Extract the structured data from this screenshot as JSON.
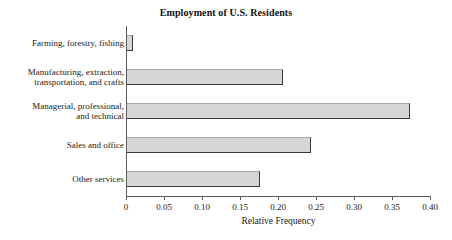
{
  "page": {
    "cropped_top_line": "",
    "background_color": "#ffffff"
  },
  "chart_data": {
    "type": "bar",
    "orientation": "horizontal",
    "title": "Employment of U.S. Residents",
    "xlabel": "Relative Frequency",
    "ylabel": "",
    "xlim": [
      0,
      0.4
    ],
    "grid": false,
    "legend": null,
    "bar_color": "#d6d6d6",
    "bar_edge_color": "#3a3a3a",
    "axis_color": "#5a5a5a",
    "xticks": [
      0,
      0.05,
      0.1,
      0.15,
      0.2,
      0.25,
      0.3,
      0.35,
      0.4
    ],
    "xtick_labels": [
      "0",
      "0.05",
      "0.10",
      "0.15",
      "0.20",
      "0.25",
      "0.30",
      "0.35",
      "0.40"
    ],
    "categories": [
      "Farming, forestry, fishing",
      "Manufacturing, extraction,\ntransportation, and crafts",
      "Managerial, professional,\nand technical",
      "Sales and office",
      "Other services"
    ],
    "values": [
      0.008,
      0.205,
      0.372,
      0.242,
      0.175
    ]
  }
}
